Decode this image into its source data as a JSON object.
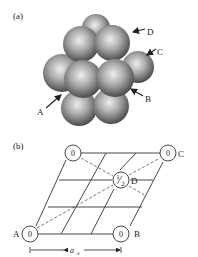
{
  "panel_a": {
    "label": "(a)",
    "arrows": [
      {
        "label": "A"
      },
      {
        "label": "B"
      },
      {
        "label": "C"
      },
      {
        "label": "D"
      }
    ]
  },
  "panel_b": {
    "label": "(b)",
    "atoms": [
      {
        "value": "0",
        "label": ""
      },
      {
        "value": "0",
        "label": "C"
      },
      {
        "value": "0",
        "label": "A"
      },
      {
        "value": "0",
        "label": "B"
      },
      {
        "value_num": "1",
        "value_den": "2",
        "label": "D"
      }
    ],
    "dimension_label": "a",
    "dimension_subscript": "0"
  },
  "colors": {
    "sphere_light": "#e8e8e8",
    "sphere_mid": "#8a8a8a",
    "sphere_dark": "#3a3a3a",
    "line": "#333333"
  }
}
